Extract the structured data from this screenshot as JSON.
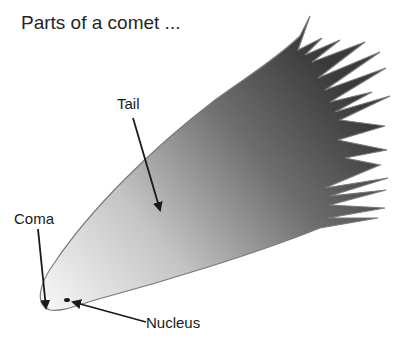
{
  "title": "Parts of a comet ...",
  "labels": {
    "tail": "Tail",
    "coma": "Coma",
    "nucleus": "Nucleus"
  },
  "colors": {
    "tail_dark": "#3c3c3c",
    "tail_mid": "#8a8a8a",
    "coma_light": "#f4f4f4",
    "outline": "#7a7a7a",
    "arrow": "#1a1a1a",
    "text": "#262626"
  }
}
